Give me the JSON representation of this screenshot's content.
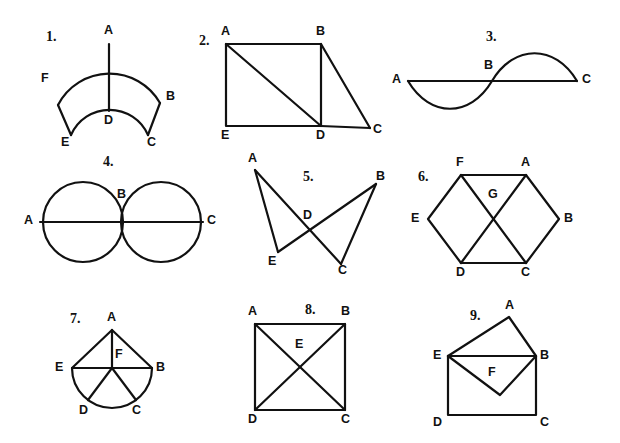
{
  "page": {
    "width": 620,
    "height": 443,
    "background_color": "#ffffff",
    "ink_color": "#111111"
  },
  "figures": [
    {
      "number": "1.",
      "description": "annulus sector (fan) with radial segment A to D",
      "labels": {
        "A": "A",
        "B": "B",
        "C": "C",
        "D": "D",
        "E": "E",
        "F": "F"
      }
    },
    {
      "number": "2.",
      "description": "square A E D B with diagonal A to D, plus triangle B D C",
      "labels": {
        "A": "A",
        "B": "B",
        "C": "C",
        "D": "D",
        "E": "E"
      }
    },
    {
      "number": "3.",
      "description": "sine wave crossing straight segment A to C, midpoint B",
      "labels": {
        "A": "A",
        "B": "B",
        "C": "C"
      }
    },
    {
      "number": "4.",
      "description": "two tangent circles with horizontal line A to C through centers, tangency at B",
      "labels": {
        "A": "A",
        "B": "B",
        "C": "C"
      }
    },
    {
      "number": "5.",
      "description": "bowtie: segments A-C and B-E cross at D, with edges A-E and B-C",
      "labels": {
        "A": "A",
        "B": "B",
        "C": "C",
        "D": "D",
        "E": "E"
      }
    },
    {
      "number": "6.",
      "description": "hexagon A B C D E F with diagonals F-C and A-D meeting at G",
      "labels": {
        "A": "A",
        "B": "B",
        "C": "C",
        "D": "D",
        "E": "E",
        "F": "F",
        "G": "G"
      }
    },
    {
      "number": "7.",
      "description": "triangle A E B above semicircle E D C B, spokes from centre F to A, D and C",
      "labels": {
        "A": "A",
        "B": "B",
        "C": "C",
        "D": "D",
        "E": "E",
        "F": "F"
      }
    },
    {
      "number": "8.",
      "description": "square A B C D with both diagonals crossing at E",
      "labels": {
        "A": "A",
        "B": "B",
        "C": "C",
        "D": "D",
        "E": "E"
      }
    },
    {
      "number": "9.",
      "description": "envelope: rectangle E D C B, triangle E A B on top, inverted triangle E F B inside",
      "labels": {
        "A": "A",
        "B": "B",
        "C": "C",
        "D": "D",
        "E": "E",
        "F": "F"
      }
    }
  ]
}
